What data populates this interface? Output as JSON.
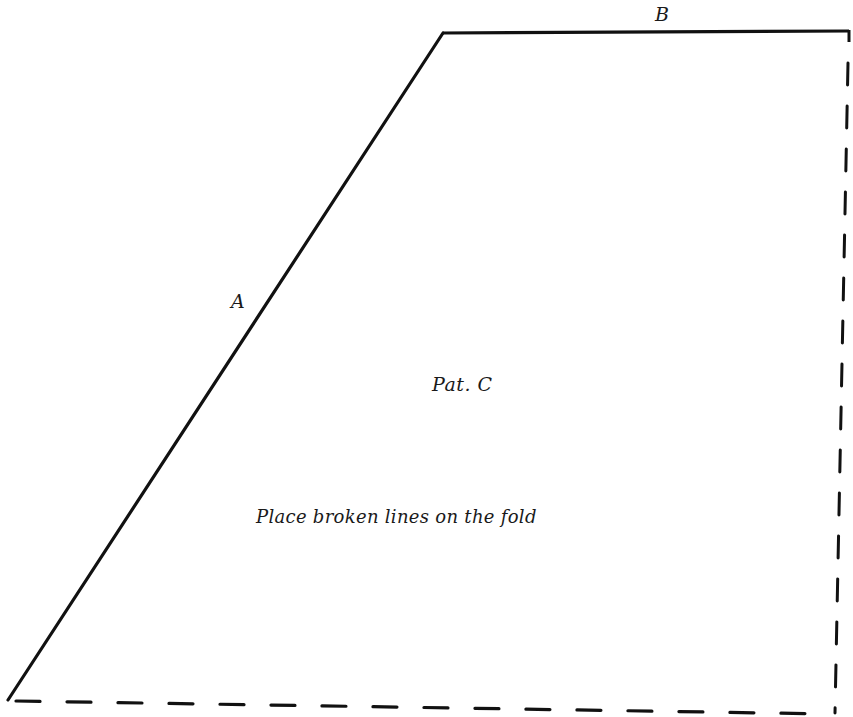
{
  "pattern": {
    "name": "Pat. C",
    "instruction": "Place broken lines on the fold",
    "edges": {
      "a": {
        "label": "A",
        "style": "solid"
      },
      "b": {
        "label": "B",
        "style": "solid"
      },
      "right_fold": {
        "style": "dashed"
      },
      "bottom_fold": {
        "style": "dashed"
      }
    },
    "vertices": {
      "top_left": [
        443,
        33
      ],
      "top_right": [
        849,
        31
      ],
      "bottom_right": [
        835,
        713
      ],
      "bottom_left": [
        8,
        700
      ]
    }
  },
  "colors": {
    "line": "#111111",
    "background": "#ffffff",
    "text": "#1a1a1a"
  }
}
